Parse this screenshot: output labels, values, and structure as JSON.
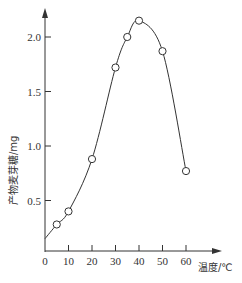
{
  "chart_data": {
    "type": "line",
    "title": "",
    "xlabel": "温度/℃",
    "ylabel": "产物麦芽糖/mg",
    "xlim": [
      0,
      65
    ],
    "ylim": [
      0,
      2.3
    ],
    "x_ticks": [
      "0",
      "10",
      "20",
      "30",
      "40",
      "50",
      "60"
    ],
    "y_ticks": [
      "0.5",
      "1.0",
      "1.5",
      "2.0"
    ],
    "grid": false,
    "legend": null,
    "series": [
      {
        "name": "产物麦芽糖",
        "marker": "open-circle",
        "smooth": true,
        "x": [
          5,
          10,
          20,
          30,
          35,
          40,
          50,
          60
        ],
        "y": [
          0.28,
          0.4,
          0.88,
          1.72,
          2.0,
          2.15,
          1.87,
          0.77
        ]
      }
    ],
    "curve_start": {
      "x": 0,
      "y": 0.15
    }
  },
  "colors": {
    "line": "#333333",
    "marker_fill": "#ffffff",
    "axis": "#333333"
  }
}
